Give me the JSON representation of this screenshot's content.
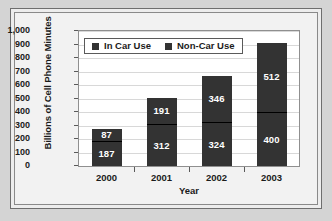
{
  "chart_data": {
    "type": "bar",
    "subtype": "stacked-bar",
    "title": "",
    "xlabel": "Year",
    "ylabel": "Billions of Cell Phone Minutes",
    "categories": [
      "2000",
      "2001",
      "2002",
      "2003"
    ],
    "series": [
      {
        "name": "In Car Use",
        "values": [
          187,
          312,
          324,
          400
        ]
      },
      {
        "name": "Non-Car Use",
        "values": [
          87,
          191,
          346,
          512
        ]
      }
    ],
    "totals": [
      274,
      503,
      670,
      912
    ],
    "ylim": [
      0,
      1000
    ],
    "ytick_step": 100,
    "ytick_labels": [
      "1,000",
      "900",
      "800",
      "700",
      "600",
      "500",
      "400",
      "300",
      "200",
      "100",
      "0"
    ],
    "grid": true,
    "legend_position": "top-left-inside",
    "colors": {
      "bar": "#333333",
      "data_label": "#ffffff",
      "gridline": "#d8d8d8",
      "plot_background": "#ffffff",
      "figure_background": "#f1f1f1",
      "axis_text": "#1b1b1b",
      "border": "#8f8f8f"
    }
  }
}
